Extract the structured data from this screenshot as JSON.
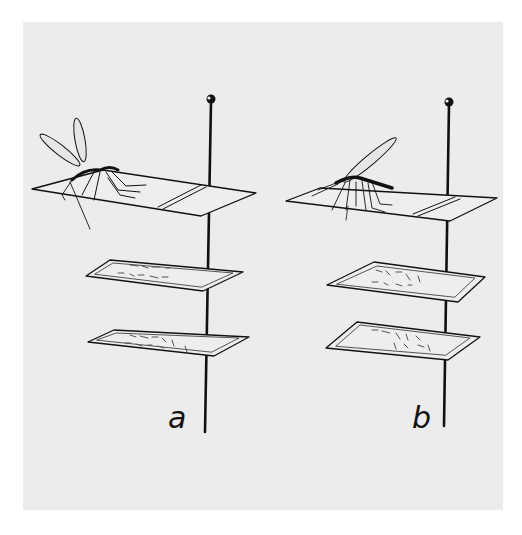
{
  "figure": {
    "panels": [
      {
        "id": "a",
        "label": "a",
        "specimen": "mosquito on card, wings raised, body upright"
      },
      {
        "id": "b",
        "label": "b",
        "specimen": "mosquito on card, wings angled back, abdomen horizontal"
      }
    ],
    "colors": {
      "background": "#ffffff",
      "panel": "#ececec",
      "ink": "#111111"
    }
  }
}
